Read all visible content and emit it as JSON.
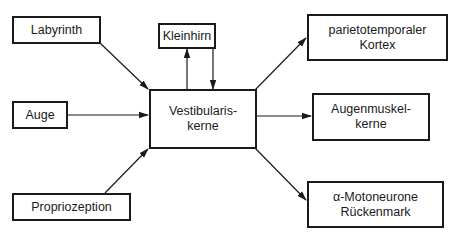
{
  "diagram": {
    "nodes": {
      "labyrinth": {
        "lines": [
          "Labyrinth"
        ]
      },
      "auge": {
        "lines": [
          "Auge"
        ]
      },
      "propriozeption": {
        "lines": [
          "Propriozeption"
        ]
      },
      "kleinhirn": {
        "lines": [
          "Kleinhirn"
        ]
      },
      "vestibulariskerne": {
        "lines": [
          "Vestibularis-",
          "kerne"
        ]
      },
      "kortex": {
        "lines": [
          "parietotemporaler",
          "Kortex"
        ]
      },
      "augenmuskelkerne": {
        "lines": [
          "Augenmuskel-",
          "kerne"
        ]
      },
      "motoneurone": {
        "lines": [
          "α-Motoneurone",
          "Rückenmark"
        ]
      }
    },
    "edges": [
      {
        "from": "Labyrinth",
        "to": "Vestibulariskerne"
      },
      {
        "from": "Auge",
        "to": "Vestibulariskerne"
      },
      {
        "from": "Propriozeption",
        "to": "Vestibulariskerne"
      },
      {
        "from": "Vestibulariskerne",
        "to": "Kleinhirn"
      },
      {
        "from": "Kleinhirn",
        "to": "Vestibulariskerne"
      },
      {
        "from": "Vestibulariskerne",
        "to": "parietotemporaler Kortex"
      },
      {
        "from": "Vestibulariskerne",
        "to": "Augenmuskelkerne"
      },
      {
        "from": "Vestibulariskerne",
        "to": "α-Motoneurone Rückenmark"
      }
    ],
    "colors": {
      "stroke": "#1a1a1a",
      "background": "#ffffff"
    }
  }
}
